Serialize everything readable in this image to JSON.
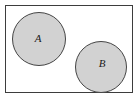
{
  "diagram": {
    "type": "venn-disjoint-sets",
    "title": "",
    "universe": {
      "name": "universal-set-rectangle",
      "label": "",
      "x": 5.5,
      "y": 5.5,
      "width": 127,
      "height": 87,
      "fill": "#ffffff",
      "stroke": "#3d3d3d",
      "stroke_width": 1
    },
    "sets": [
      {
        "id": "A",
        "label": "A",
        "name": "set-a-circle",
        "cx": 39,
        "cy": 39,
        "r": 26.5,
        "fill": "#d2d2d2",
        "stroke": "#454545",
        "stroke_width": 1,
        "label_x": 38,
        "label_y": 39
      },
      {
        "id": "B",
        "label": "B",
        "name": "set-b-circle",
        "cx": 101,
        "cy": 67,
        "r": 25.5,
        "fill": "#d2d2d2",
        "stroke": "#454545",
        "stroke_width": 1,
        "label_x": 102,
        "label_y": 64
      }
    ],
    "relationship": "disjoint",
    "colors": {
      "set_fill": "#d2d2d2",
      "set_stroke": "#454545",
      "universe_fill": "#ffffff",
      "universe_stroke": "#3d3d3d",
      "label_color": "#1a1a1a",
      "page_background": "#ffffff"
    }
  }
}
